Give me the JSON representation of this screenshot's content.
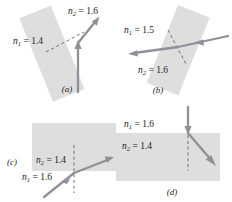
{
  "figure": {
    "ray_color": "#8e9197",
    "slab_color": "#d8d8d8",
    "panels": [
      {
        "id": "a",
        "label": "(a)",
        "media": [
          {
            "symbol": "n",
            "subscript": "1",
            "equals": "=",
            "value": "1.4"
          },
          {
            "symbol": "n",
            "subscript": "2",
            "equals": "=",
            "value": "1.6"
          }
        ],
        "incident_direction": "up",
        "refracted_direction": "up-right",
        "slab_rotation_deg": -22
      },
      {
        "id": "b",
        "label": "(b)",
        "media": [
          {
            "symbol": "n",
            "subscript": "1",
            "equals": "=",
            "value": "1.5"
          },
          {
            "symbol": "n",
            "subscript": "2",
            "equals": "=",
            "value": "1.6"
          }
        ],
        "incident_direction": "left",
        "refracted_direction": "left-down",
        "slab_rotation_deg": 22
      },
      {
        "id": "c",
        "label": "(c)",
        "media": [
          {
            "symbol": "n",
            "subscript": "2",
            "equals": "=",
            "value": "1.4"
          },
          {
            "symbol": "n",
            "subscript": "1",
            "equals": "=",
            "value": "1.6"
          }
        ],
        "incident_direction": "up-right",
        "refracted_direction": "up-right",
        "slab_rotation_deg": 0
      },
      {
        "id": "d",
        "label": "(d)",
        "media": [
          {
            "symbol": "n",
            "subscript": "1",
            "equals": "=",
            "value": "1.6"
          },
          {
            "symbol": "n",
            "subscript": "2",
            "equals": "=",
            "value": "1.4"
          }
        ],
        "incident_direction": "down",
        "refracted_direction": "down-right",
        "slab_rotation_deg": 0
      }
    ]
  }
}
